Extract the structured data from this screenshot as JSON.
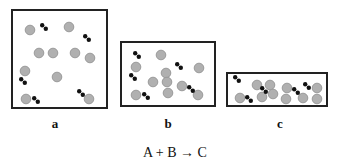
{
  "figure": {
    "equation": "A + B → C",
    "panels": [
      {
        "label": "a",
        "box": {
          "x": 12,
          "y": 10,
          "w": 95,
          "h": 98
        },
        "atoms_B": [
          [
            30,
            30
          ],
          [
            69,
            27
          ],
          [
            39,
            53
          ],
          [
            53,
            53
          ],
          [
            75,
            53
          ],
          [
            90,
            58
          ],
          [
            25,
            71
          ],
          [
            57,
            77
          ],
          [
            26,
            99
          ],
          [
            89,
            99
          ]
        ],
        "molecules_A": [
          [
            44,
            27
          ],
          [
            87,
            38
          ],
          [
            23,
            81
          ],
          [
            36,
            100
          ],
          [
            81,
            93
          ]
        ]
      },
      {
        "label": "b",
        "box": {
          "x": 121,
          "y": 42,
          "w": 94,
          "h": 64
        },
        "atoms_B": [
          [
            161,
            55
          ],
          [
            136,
            67
          ],
          [
            199,
            68
          ],
          [
            166,
            73
          ],
          [
            153,
            82
          ],
          [
            167,
            82
          ],
          [
            182,
            86
          ],
          [
            168,
            93
          ],
          [
            136,
            95
          ],
          [
            198,
            95
          ]
        ],
        "molecules_A": [
          [
            137,
            55
          ],
          [
            179,
            66
          ],
          [
            133,
            77
          ],
          [
            191,
            89
          ],
          [
            146,
            96
          ]
        ]
      },
      {
        "label": "c",
        "box": {
          "x": 227,
          "y": 73,
          "w": 100,
          "h": 33
        },
        "atoms_B": [
          [
            240,
            98
          ],
          [
            257,
            85
          ],
          [
            270,
            85
          ],
          [
            262,
            97
          ],
          [
            273,
            94
          ],
          [
            287,
            88
          ],
          [
            286,
            99
          ],
          [
            303,
            98
          ],
          [
            317,
            88
          ],
          [
            317,
            99
          ]
        ],
        "molecules_A": [
          [
            237,
            79
          ],
          [
            249,
            99
          ],
          [
            264,
            90
          ],
          [
            296,
            91
          ],
          [
            307,
            86
          ]
        ]
      }
    ],
    "label_positions": [
      [
        55,
        128
      ],
      [
        168,
        128
      ],
      [
        280,
        128
      ]
    ],
    "colors": {
      "box": "#222222",
      "atom_fill": "#b0b0b0",
      "atom_stroke": "#9a9a9a",
      "molecule": "#111111"
    }
  }
}
